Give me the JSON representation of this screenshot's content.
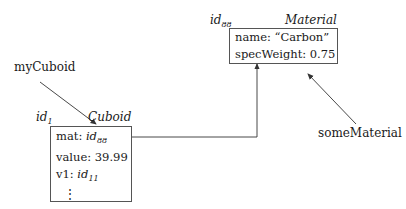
{
  "variables": {
    "myCuboid": "myCuboid",
    "someMaterial": "someMaterial"
  },
  "cuboid_object": {
    "id_prefix": "id",
    "id_sub": "1",
    "class_name": "Cuboid",
    "fields": [
      {
        "name": "mat: ",
        "value_prefix": "id",
        "value_sub": "88"
      },
      {
        "name": "value: ",
        "value": "39.99"
      },
      {
        "name": "v1: ",
        "value_prefix": "id",
        "value_sub": "11"
      }
    ],
    "ellipsis": "⋮"
  },
  "material_object": {
    "id_prefix": "id",
    "id_sub": "88",
    "class_name": "Material",
    "fields": [
      {
        "name": "name: ",
        "value": "“Carbon”"
      },
      {
        "name": "specWeight: ",
        "value": "0.75"
      }
    ]
  },
  "colors": {
    "line": "#333333",
    "border": "#555555"
  }
}
